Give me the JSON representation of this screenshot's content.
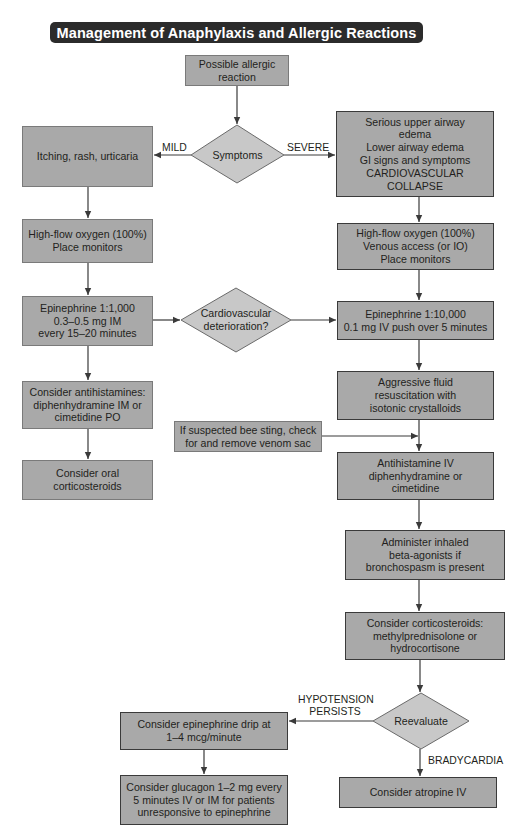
{
  "title": "Management of Anaphylaxis and Allergic Reactions",
  "nodes": {
    "start": "Possible allergic\nreaction",
    "symptoms": "Symptoms",
    "mild_symptoms": "Itching, rash, urticaria",
    "severe_symptoms": "Serious upper airway\nedema\nLower airway edema\nGI signs and symptoms\nCARDIOVASCULAR\nCOLLAPSE",
    "mild_oxygen": "High-flow oxygen (100%)\nPlace monitors",
    "severe_oxygen": "High-flow oxygen (100%)\nVenous access (or IO)\nPlace monitors",
    "mild_epinephrine": "Epinephrine 1:1,000\n0.3–0.5 mg IM\nevery 15–20 minutes",
    "cardio_deterioration": "Cardiovascular\ndeterioration?",
    "severe_epinephrine": "Epinephrine 1:10,000\n0.1 mg IV push over 5 minutes",
    "mild_antihistamines": "Consider antihistamines:\ndiphenhydramine IM or\ncimetidine PO",
    "fluid_resuscitation": "Aggressive fluid\nresuscitation with\nisotonic crystalloids",
    "bee_sting": "If suspected bee sting, check\nfor and remove venom sac",
    "severe_antihistamine": "Antihistamine IV\ndiphenhydramine or\ncimetidine",
    "oral_corticosteroids": "Consider oral\ncorticosteroids",
    "beta_agonists": "Administer inhaled\nbeta-agonists if\nbronchospasm is present",
    "iv_corticosteroids": "Consider corticosteroids:\nmethylprednisolone or\nhydrocortisone",
    "reevaluate": "Reevaluate",
    "epinephrine_drip": "Consider epinephrine drip at\n1–4 mcg/minute",
    "glucagon": "Consider glucagon 1–2 mg every\n5 minutes IV or IM for patients\nunresponsive to epinephrine",
    "atropine": "Consider atropine IV"
  },
  "edge_labels": {
    "mild": "MILD",
    "severe": "SEVERE",
    "hypotension": "HYPOTENSION\nPERSISTS",
    "bradycardia": "BRADYCARDIA"
  },
  "colors": {
    "title_bg": "#2b2b2b",
    "title_text": "#ffffff",
    "box_fill": "#a9a9a9",
    "diamond_fill": "#c8c8c8",
    "line": "#3a3a3a"
  }
}
